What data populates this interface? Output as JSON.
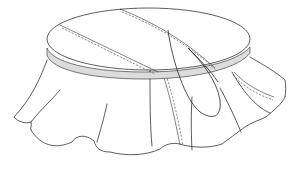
{
  "figure": {
    "style": "technical line drawing",
    "colors": {
      "background": "#ffffff",
      "line": "#333333",
      "band_fill": "#dcdcdc"
    },
    "parts": [
      {
        "name": "circular-top",
        "description": "elliptical tabletop panel with two diagonal stitched seams"
      },
      {
        "name": "edge-band",
        "description": "grey shaded band around the top edge"
      },
      {
        "name": "flared-skirt",
        "description": "draped skirt with scalloped hem and folds"
      },
      {
        "name": "thread-loop",
        "description": "long loop of thread hanging from the top seam"
      }
    ]
  }
}
